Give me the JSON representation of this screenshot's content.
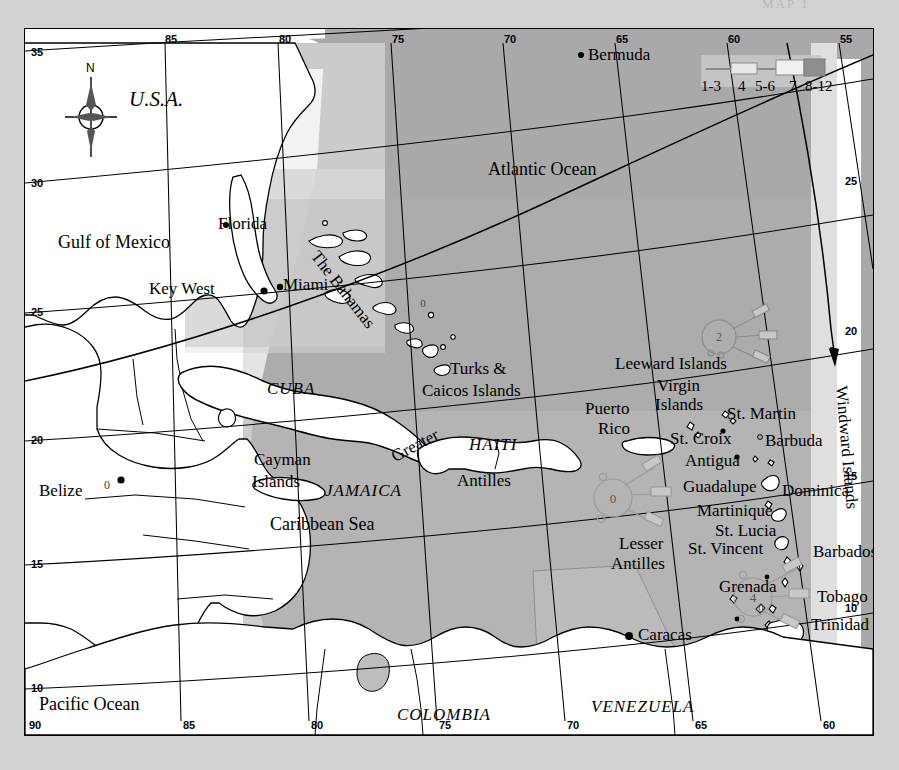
{
  "page": {
    "background_color": "#d2d2d2",
    "cut_off_header": "MAP 1"
  },
  "map": {
    "title_visible": false,
    "frame_border_color": "#000000",
    "land_color": "#ffffff",
    "sea_color": "#a9a9a9",
    "inset_color": "#bdbdbd",
    "compass": {
      "label": "N"
    },
    "legend": {
      "labels": [
        "1-3",
        "4",
        "5-6",
        "7",
        "8-12"
      ],
      "caption": ""
    },
    "graticule": {
      "top_labels": [
        "85",
        "80",
        "75",
        "70",
        "65",
        "60",
        "55"
      ],
      "bottom_labels": [
        "90",
        "85",
        "80",
        "75",
        "70",
        "65",
        "60"
      ],
      "left_labels": [
        "35",
        "30",
        "25",
        "20",
        "15",
        "10"
      ],
      "left_corner_label": "90",
      "right_labels": [
        "25",
        "20",
        "15",
        "10"
      ]
    },
    "oceans": [
      {
        "name": "Atlantic Ocean"
      },
      {
        "name": "Gulf of Mexico"
      },
      {
        "name": "Caribbean Sea"
      },
      {
        "name": "Pacific Ocean"
      }
    ],
    "countries_italic": [
      {
        "name": "U.S.A."
      },
      {
        "name": "CUBA"
      },
      {
        "name": "HAITI"
      },
      {
        "name": "JAMAICA"
      },
      {
        "name": "COLOMBIA"
      },
      {
        "name": "VENEZUELA"
      }
    ],
    "places": [
      {
        "name": "Bermuda"
      },
      {
        "name": "Florida"
      },
      {
        "name": "Key West"
      },
      {
        "name": "Miami"
      },
      {
        "name": "The Bahamas"
      },
      {
        "name": "Turks &"
      },
      {
        "name": "Caicos Islands"
      },
      {
        "name": "Leeward Islands"
      },
      {
        "name": "Virgin"
      },
      {
        "name": "Islands"
      },
      {
        "name": "Puerto"
      },
      {
        "name": "Rico"
      },
      {
        "name": "St. Martin"
      },
      {
        "name": "St. Croix"
      },
      {
        "name": "Barbuda"
      },
      {
        "name": "Antigua"
      },
      {
        "name": "Guadalupe"
      },
      {
        "name": "Dominica"
      },
      {
        "name": "Martinique"
      },
      {
        "name": "St. Lucia"
      },
      {
        "name": "St. Vincent"
      },
      {
        "name": "Barbados"
      },
      {
        "name": "Grenada"
      },
      {
        "name": "Tobago"
      },
      {
        "name": "Trinidad"
      },
      {
        "name": "Lesser"
      },
      {
        "name": "Antilles"
      },
      {
        "name": "Greater"
      },
      {
        "name": "Antilles"
      },
      {
        "name": "Windward Islands"
      },
      {
        "name": "Cayman"
      },
      {
        "name": "Islands"
      },
      {
        "name": "Belize"
      },
      {
        "name": "Caracas"
      }
    ],
    "labels": {
      "bermuda": "Bermuda",
      "atlantic_ocean": "Atlantic Ocean",
      "usa": "U.S.A.",
      "gulf_of_mexico": "Gulf of Mexico",
      "florida": "Florida",
      "key_west": "Key West",
      "miami": "Miami",
      "the_bahamas": "The Bahamas",
      "cuba": "CUBA",
      "turks": "Turks &",
      "caicos": "Caicos Islands",
      "leeward_islands": "Leeward Islands",
      "virgin": "Virgin",
      "virgin_islands": "Islands",
      "puerto": "Puerto",
      "rico": "Rico",
      "st_martin": "St. Martin",
      "st_croix": "St. Croix",
      "barbuda": "Barbuda",
      "antigua": "Antigua",
      "guadalupe": "Guadalupe",
      "dominica": "Dominica",
      "martinique": "Martinique",
      "st_lucia": "St. Lucia",
      "st_vincent": "St. Vincent",
      "barbados": "Barbados",
      "grenada": "Grenada",
      "tobago": "Tobago",
      "trinidad": "Trinidad",
      "lesser": "Lesser",
      "lesser_antilles": "Antilles",
      "greater": "Greater",
      "greater_antilles": "Antilles",
      "windward_islands": "Windward Islands",
      "haiti": "HAITI",
      "jamaica": "JAMAICA",
      "cayman": "Cayman",
      "cayman_islands": "Islands",
      "caribbean_sea": "Caribbean Sea",
      "belize": "Belize",
      "caracas": "Caracas",
      "colombia": "COLOMBIA",
      "venezuela": "VENEZUELA",
      "pacific_ocean": "Pacific Ocean"
    },
    "wind_roses": [
      {
        "id": "rose-leeward",
        "center_value": "2"
      },
      {
        "id": "rose-puerto-rico",
        "center_value": "0"
      },
      {
        "id": "rose-grenada",
        "center_value": "4"
      },
      {
        "id": "rose-belize",
        "center_value": "0"
      },
      {
        "id": "rose-bahamas",
        "center_value": "0"
      },
      {
        "id": "rose-st-vincent",
        "center_value": "0"
      }
    ]
  }
}
